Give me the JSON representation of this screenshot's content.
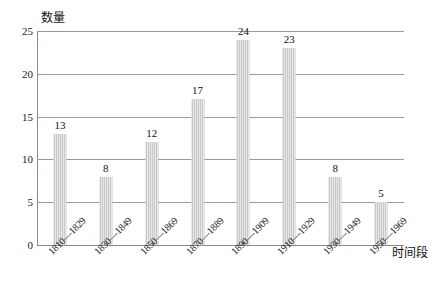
{
  "chart_data": {
    "type": "bar",
    "title": "",
    "subtitle": "",
    "xlabel": "时间段",
    "ylabel": "数量",
    "categories": [
      "1810—1829",
      "1830—1849",
      "1850—1869",
      "1870—1889",
      "1890—1909",
      "1910—1929",
      "1930—1949",
      "1950—1969"
    ],
    "values": [
      13,
      8,
      12,
      17,
      24,
      23,
      8,
      5
    ],
    "value_labels": [
      "13",
      "8",
      "12",
      "17",
      "24",
      "23",
      "8",
      "5"
    ],
    "ylim": [
      0,
      25
    ],
    "yticks": [
      0,
      5,
      10,
      15,
      20,
      25
    ],
    "ytick_labels": [
      "0",
      "5",
      "10",
      "15",
      "20",
      "25"
    ],
    "grid": "horizontal",
    "legend": "none",
    "bar_color": "#c9c9c9",
    "grid_color": "#9a9a9a",
    "axis_color": "#8a8a8a",
    "text_color": "#111111",
    "show_value_labels": true,
    "xtick_label_rotation": -45
  }
}
